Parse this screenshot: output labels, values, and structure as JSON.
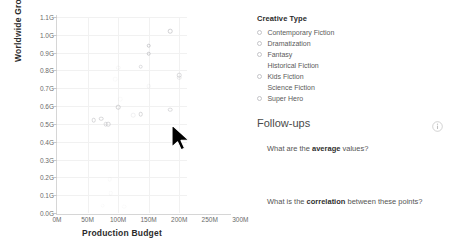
{
  "chart_data": {
    "type": "scatter",
    "title": "",
    "xlabel": "Production Budget",
    "ylabel": "Worldwide Gross",
    "xlim": [
      0,
      300000000
    ],
    "ylim": [
      0,
      1100000000
    ],
    "xticks": [
      "0M",
      "50M",
      "100M",
      "150M",
      "200M",
      "250M",
      "300M"
    ],
    "xtick_values": [
      0,
      50000000,
      100000000,
      150000000,
      200000000,
      250000000,
      300000000
    ],
    "yticks": [
      "0.0G",
      "0.1G",
      "0.2G",
      "0.3G",
      "0.4G",
      "0.5G",
      "0.6G",
      "0.7G",
      "0.8G",
      "0.9G",
      "1.0G",
      "1.1G"
    ],
    "ytick_values": [
      0,
      0.1,
      0.2,
      0.3,
      0.4,
      0.5,
      0.6,
      0.7,
      0.8,
      0.9,
      1.0,
      1.1
    ],
    "grid": true,
    "legend_position": "right",
    "marker": "open-circle",
    "points": [
      {
        "x": 60,
        "y": 0.52,
        "opacity": 0.55
      },
      {
        "x": 72,
        "y": 0.53,
        "opacity": 0.55
      },
      {
        "x": 80,
        "y": 0.5,
        "opacity": 0.45
      },
      {
        "x": 84,
        "y": 0.5,
        "opacity": 0.55
      },
      {
        "x": 100,
        "y": 0.595,
        "opacity": 0.6
      },
      {
        "x": 125,
        "y": 0.55,
        "opacity": 0.18
      },
      {
        "x": 137,
        "y": 0.555,
        "opacity": 0.55
      },
      {
        "x": 137,
        "y": 0.82,
        "opacity": 0.45
      },
      {
        "x": 150,
        "y": 0.94,
        "opacity": 0.7
      },
      {
        "x": 150,
        "y": 0.895,
        "opacity": 0.7
      },
      {
        "x": 150,
        "y": 0.71,
        "opacity": 0.12
      },
      {
        "x": 185,
        "y": 1.02,
        "opacity": 0.65
      },
      {
        "x": 185,
        "y": 0.58,
        "opacity": 0.5
      },
      {
        "x": 200,
        "y": 0.775,
        "opacity": 0.5
      },
      {
        "x": 200,
        "y": 0.76,
        "opacity": 0.3
      },
      {
        "x": 100,
        "y": 0.815,
        "opacity": 0.1
      },
      {
        "x": 95,
        "y": 0.75,
        "opacity": 0.07
      },
      {
        "x": 103,
        "y": 0.64,
        "opacity": 0.07
      },
      {
        "x": 86,
        "y": 0.19,
        "opacity": 0.07
      },
      {
        "x": 88,
        "y": 0.11,
        "opacity": 0.07
      },
      {
        "x": 75,
        "y": 0.04,
        "opacity": 0.06
      },
      {
        "x": 110,
        "y": 0.035,
        "opacity": 0.06
      }
    ]
  },
  "legend": {
    "title": "Creative Type",
    "items": [
      {
        "label": "Contemporary Fiction",
        "marker": true
      },
      {
        "label": "Dramatization",
        "marker": true
      },
      {
        "label": "Fantasy",
        "marker": true
      },
      {
        "label": "Historical Fiction",
        "marker": false
      },
      {
        "label": "Kids Fiction",
        "marker": true
      },
      {
        "label": "Science Fiction",
        "marker": false
      },
      {
        "label": "Super Hero",
        "marker": true
      }
    ]
  },
  "followups": {
    "title": "Follow-ups",
    "info_icon": "info-icon",
    "questions": [
      {
        "prefix": "What are the ",
        "bold": "average",
        "suffix": " values?"
      },
      {
        "prefix": "What is the ",
        "bold": "correlation",
        "suffix": " between these points?"
      }
    ]
  },
  "cursor": {
    "icon": "mouse-pointer-icon",
    "x": 178,
    "y": 128
  },
  "colors": {
    "marker_stroke": "#b9b9bd",
    "grid": "#f1f1f1",
    "axis": "#d6d6d6",
    "text": "#5a5a5a",
    "heading": "#2b2b2b"
  }
}
